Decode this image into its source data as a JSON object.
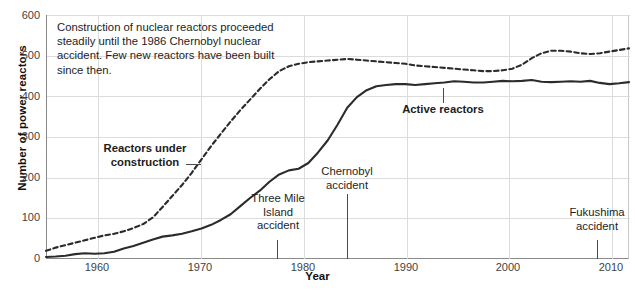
{
  "chart_data": {
    "type": "line",
    "title": "",
    "xlabel": "Year",
    "ylabel": "Number of power reactors",
    "xlim": [
      1954,
      2014
    ],
    "ylim": [
      0,
      600
    ],
    "grid": true,
    "legend_position": "inline-annotations",
    "xticks": [
      1960,
      1970,
      1980,
      1990,
      2000,
      2010
    ],
    "xtick_labels": [
      "1960",
      "1970",
      "1980",
      "1990",
      "2000",
      "2010"
    ],
    "yticks": [
      0,
      100,
      200,
      300,
      400,
      500,
      600
    ],
    "ytick_labels": [
      "0",
      "100",
      "200",
      "300",
      "400",
      "500",
      "600"
    ],
    "x": [
      1954,
      1955,
      1956,
      1957,
      1958,
      1959,
      1960,
      1961,
      1962,
      1963,
      1964,
      1965,
      1966,
      1967,
      1968,
      1969,
      1970,
      1971,
      1972,
      1973,
      1974,
      1975,
      1976,
      1977,
      1978,
      1979,
      1980,
      1981,
      1982,
      1983,
      1984,
      1985,
      1986,
      1987,
      1988,
      1989,
      1990,
      1991,
      1992,
      1993,
      1994,
      1995,
      1996,
      1997,
      1998,
      1999,
      2000,
      2001,
      2002,
      2003,
      2004,
      2005,
      2006,
      2007,
      2008,
      2009,
      2010,
      2011,
      2012,
      2013,
      2014
    ],
    "series": [
      {
        "name": "Active reactors",
        "style": "solid",
        "values": [
          5,
          6,
          8,
          12,
          14,
          13,
          14,
          18,
          26,
          32,
          40,
          48,
          55,
          58,
          62,
          68,
          75,
          84,
          96,
          110,
          130,
          150,
          168,
          190,
          208,
          218,
          222,
          236,
          262,
          292,
          330,
          372,
          398,
          415,
          425,
          428,
          430,
          430,
          428,
          430,
          432,
          434,
          437,
          436,
          434,
          434,
          436,
          438,
          437,
          438,
          440,
          436,
          435,
          436,
          437,
          436,
          438,
          433,
          430,
          432,
          435
        ]
      },
      {
        "name": "Reactors under construction",
        "style": "dashed",
        "values": [
          20,
          28,
          34,
          40,
          46,
          52,
          58,
          62,
          68,
          76,
          86,
          102,
          128,
          155,
          182,
          212,
          245,
          278,
          308,
          338,
          366,
          392,
          418,
          442,
          462,
          474,
          480,
          484,
          486,
          488,
          490,
          492,
          490,
          488,
          486,
          484,
          482,
          480,
          476,
          474,
          472,
          470,
          468,
          466,
          464,
          462,
          462,
          464,
          468,
          478,
          494,
          506,
          512,
          512,
          510,
          506,
          504,
          506,
          510,
          514,
          518
        ]
      }
    ],
    "annotations": [
      {
        "name": "note",
        "text": "Construction of nuclear reactors proceeded steadily until the 1986 Chernobyl nuclear accident. Few new reactors have been built since then."
      },
      {
        "name": "reactors-under-construction",
        "line1": "Reactors under",
        "line2": "construction",
        "bold": true
      },
      {
        "name": "active-reactors",
        "line1": "Active reactors",
        "line2": "",
        "bold": true
      },
      {
        "name": "three-mile-island",
        "line1": "Three Mile",
        "line2": "Island",
        "line3": "accident",
        "year": 1978
      },
      {
        "name": "chernobyl",
        "line1": "Chernobyl",
        "line2": "accident",
        "year": 1986
      },
      {
        "name": "fukushima",
        "line1": "Fukushima",
        "line2": "accident",
        "year": 2011
      }
    ],
    "colors": {
      "line": "#2b2b2b",
      "grid": "#dcdcdc",
      "axis": "#8a8a8a",
      "text": "#1d1d1d"
    }
  },
  "caption": ""
}
